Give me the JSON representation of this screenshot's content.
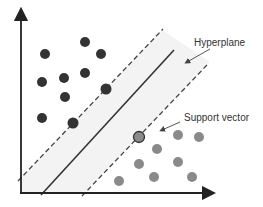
{
  "diagram": {
    "labels": {
      "hyperplane": "Hyperplane",
      "support_vector": "Support vector"
    },
    "colors": {
      "class_a": "#333333",
      "class_b": "#8a8a8a",
      "margin_fill": "#f2f2f2",
      "line": "#333333",
      "axis": "#222222"
    },
    "class_a_points": [
      [
        85,
        42
      ],
      [
        45,
        54
      ],
      [
        101,
        54
      ],
      [
        42,
        82
      ],
      [
        64,
        78
      ],
      [
        85,
        73
      ],
      [
        65,
        97
      ],
      [
        106,
        89
      ],
      [
        42,
        118
      ],
      [
        73,
        123
      ]
    ],
    "class_b_points": [
      [
        178,
        135
      ],
      [
        199,
        137
      ],
      [
        157,
        149
      ],
      [
        139,
        164
      ],
      [
        178,
        162
      ],
      [
        119,
        181
      ],
      [
        154,
        177
      ],
      [
        192,
        177
      ]
    ],
    "support_vector_point": [
      139,
      137
    ]
  }
}
